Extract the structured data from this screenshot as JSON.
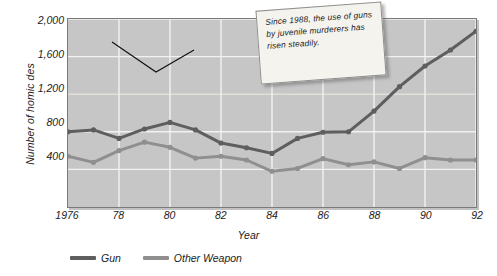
{
  "chart_data": {
    "type": "line",
    "title": "",
    "xlabel": "Year",
    "ylabel": "Number of homic des",
    "x": [
      1976,
      1977,
      1978,
      1979,
      1980,
      1981,
      1982,
      1983,
      1984,
      1985,
      1986,
      1987,
      1988,
      1989,
      1990,
      1991,
      1992
    ],
    "tick_labels_x": [
      "1976",
      "",
      "78",
      "",
      "80",
      "",
      "82",
      "",
      "84",
      "",
      "86",
      "",
      "88",
      "",
      "90",
      "",
      "92"
    ],
    "ticks_x_shown": [
      "1976",
      "78",
      "80",
      "82",
      "84",
      "86",
      "88",
      "90",
      "92"
    ],
    "ticks_y": [
      400,
      800,
      1200,
      1600,
      2000
    ],
    "tick_labels_y": [
      "400",
      "800",
      "1,200",
      "1,600",
      "2,000"
    ],
    "ylim": [
      0,
      2000
    ],
    "xlim": [
      1976,
      1992
    ],
    "grid": true,
    "legend_position": "bottom-left",
    "series": [
      {
        "name": "Gun",
        "color": "#5e5e5e",
        "values": [
          800,
          820,
          730,
          830,
          900,
          820,
          680,
          630,
          570,
          730,
          795,
          800,
          1020,
          1280,
          1500,
          1670,
          1870
        ]
      },
      {
        "name": "Other Weapon",
        "color": "#8f8f8f",
        "values": [
          540,
          475,
          600,
          690,
          635,
          520,
          540,
          500,
          380,
          410,
          515,
          450,
          480,
          410,
          525,
          500,
          500
        ]
      }
    ],
    "annotations": [
      {
        "name": "callout",
        "text": "Since 1988, the use of guns by juvenile murderers has risen steadily.",
        "points_to_year": 1990
      }
    ]
  },
  "legend": {
    "items": [
      {
        "label": "Gun",
        "color": "#5e5e5e"
      },
      {
        "label": "Other Weapon",
        "color": "#8f8f8f"
      }
    ]
  },
  "axes": {
    "x_title": "Year",
    "y_title": "Number of homic des"
  },
  "callout": {
    "text": "Since 1988, the use of guns by juvenile murderers has risen steadily."
  },
  "colors": {
    "plot_background": "#c6c6c6",
    "gridline": "#f2f2f2",
    "frame": "#7a7a7a",
    "gun": "#5e5e5e",
    "other_weapon": "#8f8f8f",
    "callout_background": "#f4f3ee"
  }
}
